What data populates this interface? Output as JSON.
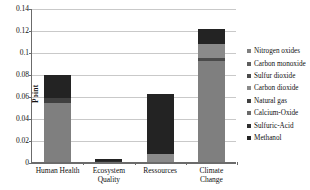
{
  "chart_data": {
    "type": "bar",
    "stacked": true,
    "title": "",
    "xlabel": "",
    "ylabel": "Point",
    "ylim": [
      0,
      0.14
    ],
    "ytick_labels": [
      "0",
      "0.02",
      "0.04",
      "0.06",
      "0.08",
      "0.1",
      "0.12",
      "0.14"
    ],
    "ytick_values": [
      0,
      0.02,
      0.04,
      0.06,
      0.08,
      0.1,
      0.12,
      0.14
    ],
    "grid": true,
    "legend_position": "right",
    "categories": [
      "Human Health",
      "Ecosystem\nQuality",
      "Ressources",
      "Climate Change"
    ],
    "series": [
      {
        "name": "Nitrogen oxides",
        "color": "#7f7f7f",
        "values": [
          0.054,
          0.0,
          0.0,
          0.092
        ]
      },
      {
        "name": "Carbon monoxide",
        "color": "#5e5e5e",
        "values": [
          0.0,
          0.0,
          0.0,
          0.0
        ]
      },
      {
        "name": "Sulfur dioxide",
        "color": "#4a4a4a",
        "values": [
          0.0,
          0.0,
          0.0,
          0.003
        ]
      },
      {
        "name": "Carbon dioxide",
        "color": "#8a8a8a",
        "values": [
          0.0,
          0.0,
          0.007,
          0.012
        ]
      },
      {
        "name": "Natural gas",
        "color": "#404040",
        "values": [
          0.004,
          0.0,
          0.0,
          0.0
        ]
      },
      {
        "name": "Calcium-Oxide",
        "color": "#6a6a6a",
        "values": [
          0.0,
          0.0,
          0.0,
          0.0
        ]
      },
      {
        "name": "Sulfuric-Acid",
        "color": "#2e2e2e",
        "values": [
          0.0,
          0.0005,
          0.0,
          0.0
        ]
      },
      {
        "name": "Methanol",
        "color": "#232323",
        "values": [
          0.021,
          0.002,
          0.055,
          0.014
        ]
      }
    ],
    "totals": [
      0.079,
      0.0025,
      0.062,
      0.121
    ]
  },
  "legend": {
    "items": [
      {
        "label": "Nitrogen oxides"
      },
      {
        "label": "Carbon monoxide"
      },
      {
        "label": "Sulfur dioxide"
      },
      {
        "label": "Carbon dioxide"
      },
      {
        "label": "Natural gas"
      },
      {
        "label": "Calcium-Oxide"
      },
      {
        "label": "Sulfuric-Acid"
      },
      {
        "label": "Methanol"
      }
    ]
  }
}
